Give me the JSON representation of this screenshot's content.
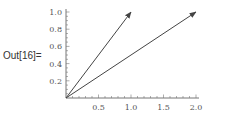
{
  "cell": {
    "output_label": "Out[16]="
  },
  "chart_data": {
    "type": "line",
    "title": "",
    "xlabel": "",
    "ylabel": "",
    "xlim": [
      0,
      2.0
    ],
    "ylim": [
      0,
      1.0
    ],
    "grid": false,
    "x_ticks": [
      "0.5",
      "1.0",
      "1.5",
      "2.0"
    ],
    "y_ticks": [
      "0.2",
      "0.4",
      "0.6",
      "0.8",
      "1.0"
    ],
    "series": [
      {
        "name": "vector-1",
        "kind": "arrow",
        "from": [
          0,
          0
        ],
        "to": [
          1,
          1
        ]
      },
      {
        "name": "vector-2",
        "kind": "arrow",
        "from": [
          0,
          0
        ],
        "to": [
          2,
          1
        ]
      }
    ],
    "colors": {
      "axis": "#777777",
      "arrow": "#444444"
    }
  }
}
